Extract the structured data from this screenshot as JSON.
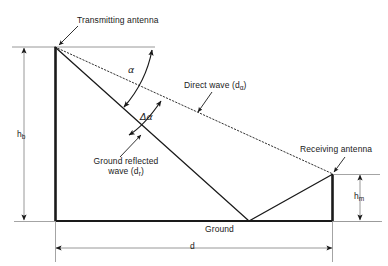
{
  "figure": {
    "type": "technical-diagram",
    "background_color": "#ffffff",
    "line_color": "#1a1a1a",
    "thin_line_color": "#888888"
  },
  "labels": {
    "transmitting_antenna": "Transmitting antenna",
    "receiving_antenna": "Receiving antenna",
    "direct_wave": "Direct wave (d",
    "direct_wave_sub": "α",
    "direct_wave_close": ")",
    "direct_wave_full": "Direct wave (dα)",
    "ground_reflected_line1": "Ground reflected",
    "ground_reflected_line2_pre": "wave (d",
    "ground_reflected_line2_sub": "r",
    "ground_reflected_line2_close": ")",
    "ground_reflected_full": "Ground reflected wave (dr)",
    "ground": "Ground",
    "alpha": "α",
    "delta_alpha": "Δα",
    "height_base_pre": "h",
    "height_base_sub": "b",
    "height_base_full": "hb",
    "height_mobile_pre": "h",
    "height_mobile_sub": "m",
    "height_mobile_full": "hm",
    "distance": "d"
  },
  "geometry": {
    "transmit_apex_x": 55,
    "transmit_apex_y": 47,
    "receive_top_x": 333,
    "receive_top_y": 174,
    "ground_y": 221,
    "ground_left_x": 55,
    "ground_right_x": 333,
    "reflection_point_x": 249,
    "reflection_point_y": 221,
    "hb_dim_x": 24,
    "hm_dim_x": 360,
    "d_dim_y": 248
  }
}
